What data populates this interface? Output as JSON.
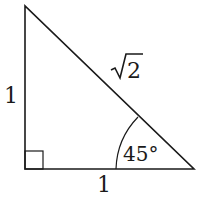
{
  "diagram": {
    "type": "right-triangle",
    "labels": {
      "left_side": "1",
      "bottom_side": "1",
      "hypotenuse_radicand": "2",
      "hypotenuse_symbol": "√",
      "angle": "45°"
    },
    "right_angle_marker": true,
    "stroke_color": "#1a1a1a",
    "background": "#ffffff"
  }
}
